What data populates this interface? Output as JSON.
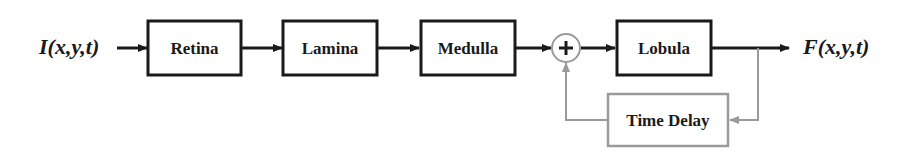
{
  "diagram": {
    "input_signal": "I(x,y,t)",
    "output_signal": "F(x,y,t)",
    "blocks": [
      {
        "id": "retina",
        "label": "Retina"
      },
      {
        "id": "lamina",
        "label": "Lamina"
      },
      {
        "id": "medulla",
        "label": "Medulla"
      },
      {
        "id": "lobula",
        "label": "Lobula"
      },
      {
        "id": "time-delay",
        "label": "Time Delay"
      }
    ],
    "summing_junction": {
      "symbol": "+"
    },
    "colors": {
      "main_path": "#1a1a1a",
      "feedback_path": "#9a9a9a"
    },
    "connections": [
      [
        "input",
        "retina"
      ],
      [
        "retina",
        "lamina"
      ],
      [
        "lamina",
        "medulla"
      ],
      [
        "medulla",
        "summing_junction"
      ],
      [
        "summing_junction",
        "lobula"
      ],
      [
        "lobula",
        "output"
      ],
      [
        "lobula",
        "time-delay"
      ],
      [
        "time-delay",
        "summing_junction"
      ]
    ]
  }
}
